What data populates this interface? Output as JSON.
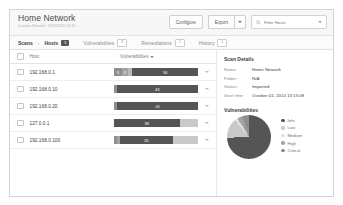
{
  "header": {
    "title": "Home Network",
    "subtitle": "Current Results: 10/1/2014 13:15",
    "configure_label": "Configure",
    "export_label": "Export",
    "export_caret_icon": "chevron-down-icon",
    "search_icon": "search-icon",
    "search_placeholder": "Filter Hosts",
    "search_value": "",
    "search_caret_icon": "chevron-down-icon"
  },
  "tabs": {
    "breadcrumb_root": "Scans",
    "breadcrumb_sep": "›",
    "breadcrumb_current": "Hosts",
    "hosts_badge": "5",
    "items": [
      {
        "label": "Vulnerabilities",
        "badge": "8"
      },
      {
        "label": "Remediations",
        "badge": "2"
      },
      {
        "label": "History",
        "badge": "1"
      }
    ]
  },
  "table": {
    "select_all_icon": "checkbox-icon",
    "col_host": "Host",
    "col_vulnerabilities": "Vulnerabilities",
    "sort_icon": "chevron-down-icon",
    "row_caret_icon": "chevron-down-icon",
    "rows": [
      {
        "host": "192.168.0.1",
        "segments": [
          {
            "severity": "Critical",
            "label": "3",
            "pct": 9,
            "color": "#8e8e8e"
          },
          {
            "severity": "High",
            "label": "2",
            "pct": 8,
            "color": "#a3a3a3"
          },
          {
            "severity": "Medium",
            "label": "",
            "pct": 5,
            "color": "#b9b9b9"
          },
          {
            "severity": "Info",
            "label": "30",
            "pct": 78,
            "color": "#555555"
          }
        ]
      },
      {
        "host": "192.168.0.10",
        "segments": [
          {
            "severity": "Critical",
            "label": "",
            "pct": 3,
            "color": "#8e8e8e"
          },
          {
            "severity": "Info",
            "label": "43",
            "pct": 97,
            "color": "#555555"
          }
        ]
      },
      {
        "host": "192.168.0.20",
        "segments": [
          {
            "severity": "Critical",
            "label": "",
            "pct": 4,
            "color": "#8e8e8e"
          },
          {
            "severity": "Info",
            "label": "41",
            "pct": 96,
            "color": "#555555"
          }
        ]
      },
      {
        "host": "127.0.0.1",
        "segments": [
          {
            "severity": "Info",
            "label": "38",
            "pct": 78,
            "color": "#555555"
          },
          {
            "severity": "Low",
            "label": "",
            "pct": 22,
            "color": "#c9c9c9"
          }
        ]
      },
      {
        "host": "192.168.0.100",
        "segments": [
          {
            "severity": "Critical",
            "label": "",
            "pct": 3,
            "color": "#8e8e8e"
          },
          {
            "severity": "High",
            "label": "",
            "pct": 4,
            "color": "#a3a3a3"
          },
          {
            "severity": "Info",
            "label": "26",
            "pct": 63,
            "color": "#555555"
          },
          {
            "severity": "Low",
            "label": "",
            "pct": 30,
            "color": "#c9c9c9"
          }
        ]
      }
    ]
  },
  "scan_details": {
    "heading": "Scan Details",
    "fields": [
      {
        "key": "Name:",
        "value": "Home Network"
      },
      {
        "key": "Folder:",
        "value": "N/A"
      },
      {
        "key": "Status:",
        "value": "Imported"
      },
      {
        "key": "Start time:",
        "value": "October 01, 2014 13:15:08"
      }
    ]
  },
  "chart_data": {
    "type": "pie",
    "title": "Vulnerabilities",
    "legend_position": "right",
    "categories": [
      "Info",
      "Low",
      "Medium",
      "High",
      "Critical"
    ],
    "values": [
      178,
      34,
      6,
      9,
      12
    ],
    "colors": [
      "#555555",
      "#c9c9c9",
      "#e0e0e0",
      "#a3a3a3",
      "#8e8e8e"
    ],
    "legend": [
      {
        "label": "Info",
        "color": "#555555"
      },
      {
        "label": "Low",
        "color": "#c9c9c9"
      },
      {
        "label": "Medium",
        "color": "#e0e0e0"
      },
      {
        "label": "High",
        "color": "#a3a3a3"
      },
      {
        "label": "Critical",
        "color": "#8e8e8e"
      }
    ]
  }
}
